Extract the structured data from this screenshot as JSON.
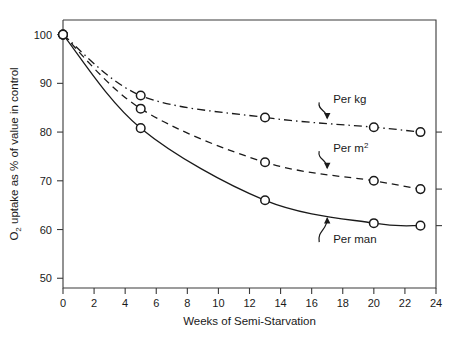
{
  "chart_data": {
    "type": "line",
    "title": "",
    "xlabel": "Weeks of Semi-Starvation",
    "ylabel": "O₂ uptake as % of value in control",
    "ylabel_parts": {
      "lead": "O",
      "sub": "2",
      "rest": " uptake as % of value in control"
    },
    "xlim": [
      0,
      24
    ],
    "ylim": [
      48,
      103
    ],
    "grid": false,
    "legend_position": "inline-annotations",
    "xticks": [
      0,
      2,
      4,
      6,
      8,
      10,
      12,
      14,
      16,
      18,
      20,
      22,
      24
    ],
    "xtick_labels": [
      "0",
      "2",
      "4",
      "6",
      "8",
      "10",
      "12",
      "14",
      "16",
      "18",
      "20",
      "22",
      "24"
    ],
    "yticks": [
      50,
      60,
      70,
      80,
      90,
      100
    ],
    "ytick_labels": [
      "50",
      "60",
      "70",
      "80",
      "90",
      "100"
    ],
    "series": [
      {
        "name": "Per kg",
        "label_parts": {
          "lead": "Per kg",
          "sup": ""
        },
        "linestyle": "dashdot",
        "color": "#1a1a1a",
        "marker": "open-circle",
        "x": [
          0,
          5,
          13,
          20,
          23
        ],
        "values": [
          100,
          87.5,
          83,
          81,
          80
        ]
      },
      {
        "name": "Per m2",
        "label_parts": {
          "lead": "Per m",
          "sup": "2"
        },
        "linestyle": "dashed",
        "color": "#1a1a1a",
        "marker": "open-circle",
        "x": [
          0,
          5,
          13,
          20,
          23
        ],
        "values": [
          100,
          84.8,
          73.8,
          70,
          68.3
        ]
      },
      {
        "name": "Per man",
        "label_parts": {
          "lead": "Per man",
          "sup": ""
        },
        "linestyle": "solid",
        "color": "#1a1a1a",
        "marker": "open-circle",
        "x": [
          0,
          5,
          13,
          20,
          23
        ],
        "values": [
          100,
          80.8,
          66,
          61.3,
          60.8
        ]
      }
    ],
    "annotations": [
      {
        "text": "Per kg",
        "points_to_series": "Per kg",
        "x": 17.0,
        "y": 86.5
      },
      {
        "text": "Per m2",
        "points_to_series": "Per m2",
        "x": 17.0,
        "y": 76.5
      },
      {
        "text": "Per man",
        "points_to_series": "Per man",
        "x": 17.0,
        "y": 57.0
      }
    ]
  },
  "figure": {
    "background_color": "#ffffff",
    "axis_color": "#3a3a3a",
    "line_color": "#1a1a1a",
    "marker_fill": "#ffffff"
  }
}
